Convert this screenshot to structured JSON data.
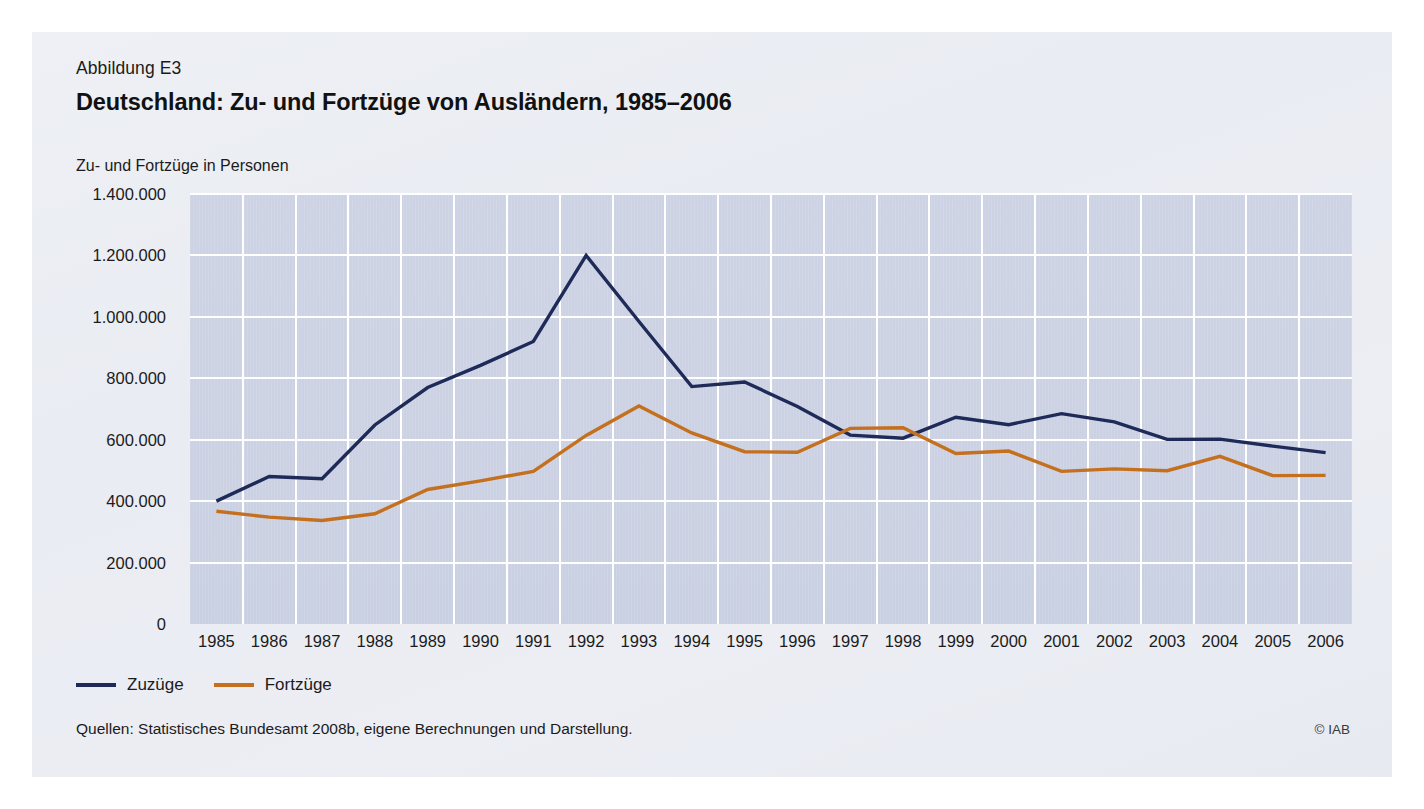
{
  "figure": {
    "number_label": "Abbildung E3",
    "title": "Deutschland: Zu- und Fortzüge von Ausländern, 1985–2006",
    "axis_caption": "Zu- und Fortzüge in Personen",
    "source_note": "Quellen: Statistisches Bundesamt 2008b, eigene Berechnungen und Darstellung.",
    "copyright": "© IAB"
  },
  "legend": {
    "position": "below-axis-left",
    "items": [
      {
        "label": "Zuzüge",
        "color": "#1e2a58"
      },
      {
        "label": "Fortzüge",
        "color": "#c4701f"
      }
    ]
  },
  "colors": {
    "zuzuege": "#1e2a58",
    "fortzuege": "#c4701f",
    "plot_background": "#ccd2e3",
    "gridline": "#ffffff",
    "figure_background": "#ebeef4",
    "text": "#1b1b1b"
  },
  "chart_data": {
    "type": "line",
    "title": "Deutschland: Zu- und Fortzüge von Ausländern, 1985–2006",
    "xlabel": "",
    "ylabel": "Zu- und Fortzüge in Personen",
    "categories": [
      "1985",
      "1986",
      "1987",
      "1988",
      "1989",
      "1990",
      "1991",
      "1992",
      "1993",
      "1994",
      "1995",
      "1996",
      "1997",
      "1998",
      "1999",
      "2000",
      "2001",
      "2002",
      "2003",
      "2004",
      "2005",
      "2006"
    ],
    "series": [
      {
        "name": "Zuzüge",
        "color": "#1e2a58",
        "values": [
          400000,
          480000,
          473000,
          648000,
          770000,
          842000,
          920000,
          1200000,
          985000,
          773000,
          788000,
          708000,
          615000,
          605000,
          673000,
          649000,
          685000,
          658000,
          601000,
          602000,
          579000,
          558000
        ]
      },
      {
        "name": "Fortzüge",
        "color": "#c4701f",
        "values": [
          367000,
          348000,
          337000,
          359000,
          438000,
          466000,
          497000,
          614000,
          710000,
          622000,
          561000,
          559000,
          637000,
          639000,
          555000,
          563000,
          497000,
          505000,
          499000,
          546000,
          483000,
          484000
        ]
      }
    ],
    "y_ticks": [
      "0",
      "200.000",
      "400.000",
      "600.000",
      "800.000",
      "1.000.000",
      "1.200.000",
      "1.400.000"
    ],
    "ylim": [
      0,
      1400000
    ],
    "y_tick_step": 200000,
    "grid": {
      "horizontal": true,
      "vertical": true
    },
    "legend_position": "bottom-left"
  }
}
